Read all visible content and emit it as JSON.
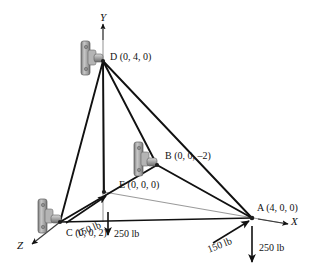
{
  "figure": {
    "type": "3d-statics-free-body-diagram",
    "background_color": "#ffffff",
    "line_color": "#111111",
    "axis_color": "#8a8a8a",
    "bracket_color": "#9a9a9a"
  },
  "axes": [
    {
      "id": "y",
      "label": "Y",
      "direction": "up"
    },
    {
      "id": "x",
      "label": "X",
      "direction": "right"
    },
    {
      "id": "z",
      "label": "Z",
      "direction": "down-left"
    }
  ],
  "points": [
    {
      "id": "D",
      "name": "D",
      "coords": "(0, 4, 0)",
      "label": "D (0, 4, 0)",
      "has_bracket": true
    },
    {
      "id": "B",
      "name": "B",
      "coords": "(0, 0, –2)",
      "label": "B (0, 0, –2)",
      "has_bracket": true
    },
    {
      "id": "E",
      "name": "E",
      "coords": "(0, 0, 0)",
      "label": "E (0, 0, 0)",
      "has_bracket": false
    },
    {
      "id": "C",
      "name": "C",
      "coords": "(0, 0, 2)",
      "label": "C (0, 0, 2)",
      "has_bracket": true
    },
    {
      "id": "A",
      "name": "A",
      "coords": "(4, 0, 0)",
      "label": "A (4, 0, 0)",
      "has_bracket": false
    }
  ],
  "forces": [
    {
      "id": "force-c-150",
      "magnitude": "150 lb",
      "at": "C",
      "direction": "up-right toward E"
    },
    {
      "id": "force-c-250",
      "magnitude": "250 lb",
      "at": "C",
      "direction": "down"
    },
    {
      "id": "force-a-150",
      "magnitude": "150 lb",
      "at": "A",
      "direction": "up-right toward A"
    },
    {
      "id": "force-a-250",
      "magnitude": "250 lb",
      "at": "A",
      "direction": "down"
    }
  ],
  "members": [
    {
      "from": "D",
      "to": "C"
    },
    {
      "from": "D",
      "to": "E"
    },
    {
      "from": "D",
      "to": "B"
    },
    {
      "from": "D",
      "to": "A"
    },
    {
      "from": "B",
      "to": "C"
    },
    {
      "from": "B",
      "to": "A"
    },
    {
      "from": "C",
      "to": "A"
    }
  ]
}
